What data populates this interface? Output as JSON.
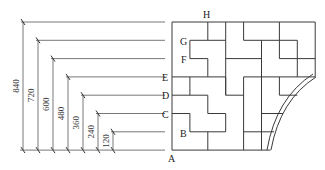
{
  "diagram": {
    "unit_step": 120,
    "dimensions": [
      "120",
      "240",
      "360",
      "480",
      "600",
      "720",
      "840"
    ],
    "point_labels": {
      "A": "A",
      "B": "B",
      "C": "C",
      "D": "D",
      "E": "E",
      "F": "F",
      "G": "G",
      "H": "H"
    },
    "grid": {
      "columns": 8,
      "rows": 7
    }
  }
}
